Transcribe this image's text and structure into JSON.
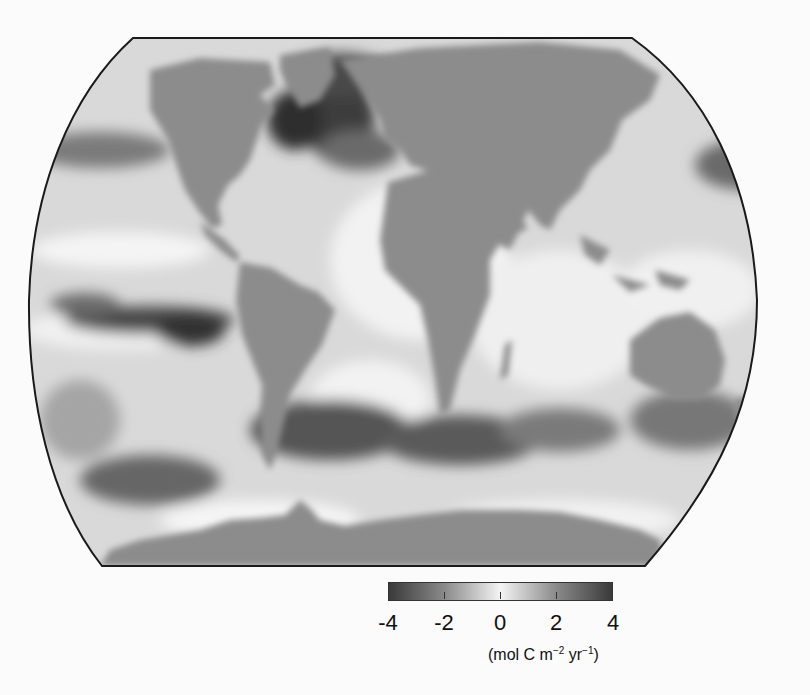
{
  "figure": {
    "type": "world-map",
    "projection": "Robinson (truncated at poles)",
    "variable": "air-sea CO2 flux",
    "color_scheme": "grayscale, diverging (dark = strong magnitude, white = near zero)",
    "land_color": "#8c8c8c",
    "outline_color": "#1a1a1a"
  },
  "colorbar": {
    "min": -4,
    "max": 4,
    "ticks": [
      "-4",
      "-2",
      "0",
      "2",
      "4"
    ],
    "units_prefix": "(mol C m",
    "units_exp1": "−2",
    "units_mid": " yr",
    "units_exp2": "−1",
    "units_suffix": ")",
    "gradient": [
      "#3a3a3a",
      "#8a8a8a",
      "#f4f4f4",
      "#8a8a8a",
      "#3a3a3a"
    ]
  },
  "features": {
    "dark_regions": [
      "North Atlantic",
      "Greenland/Norwegian Sea",
      "Eastern equatorial Pacific band",
      "Southern Ocean band ~40-50°S",
      "North Pacific ~40°N"
    ],
    "light_regions": [
      "Subtropical Atlantic",
      "Indian Ocean",
      "Western equatorial Pacific"
    ]
  }
}
